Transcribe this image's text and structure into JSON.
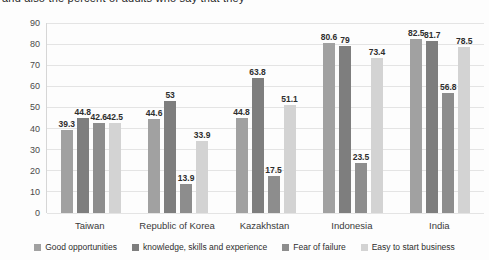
{
  "page": {
    "cropped_text": "and also the percent of adults who say that they"
  },
  "chart_data": {
    "type": "bar",
    "title": "",
    "xlabel": "",
    "ylabel": "",
    "categories": [
      "Taiwan",
      "Republic of Korea",
      "Kazakhstan",
      "Indonesia",
      "India"
    ],
    "series": [
      {
        "name": "Good opportunities",
        "color": "#a1a1a1",
        "values": [
          39.3,
          44.6,
          44.8,
          80.6,
          82.5
        ]
      },
      {
        "name": "knowledge, skills and experience",
        "color": "#7e7e7e",
        "values": [
          44.8,
          53,
          63.8,
          79,
          81.7
        ]
      },
      {
        "name": "Fear of failure",
        "color": "#8d8d8d",
        "values": [
          42.6,
          13.9,
          17.5,
          23.5,
          56.8
        ]
      },
      {
        "name": "Easy to start business",
        "color": "#d3d3d3",
        "values": [
          42.5,
          33.9,
          51.1,
          73.4,
          78.5
        ]
      }
    ],
    "y_ticks": [
      0,
      10,
      20,
      30,
      40,
      50,
      60,
      70,
      80,
      90
    ],
    "ylim": [
      0,
      90
    ],
    "grid": true,
    "legend_position": "bottom",
    "value_labels_shown": true,
    "colors": {
      "gridline": "#e4e4e4",
      "axis_line": "#d6d6d6",
      "text": "#2e2e2e"
    }
  }
}
